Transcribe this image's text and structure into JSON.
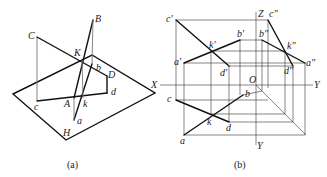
{
  "figure": {
    "panels": [
      {
        "id": "a",
        "caption": "(a)",
        "description": "Pictorial view: line AB piercing triangle-like plane CKD region with projection plane H",
        "labels": {
          "B": "B",
          "C": "C",
          "K": "K",
          "b": "b",
          "D": "D",
          "d": "d",
          "c": "c",
          "A": "A",
          "k": "k",
          "a": "a",
          "H": "H"
        }
      },
      {
        "id": "b",
        "caption": "(b)",
        "description": "Three-view orthographic projection with X, Y, Z axes and origin O",
        "labels": {
          "c1": "c'",
          "c2": "c\"",
          "Z": "Z",
          "k1": "k'",
          "b1": "b'",
          "b2": "b\"",
          "k2": "k\"",
          "a1": "a'",
          "a2": "a\"",
          "d1": "d'",
          "d2": "d\"",
          "X": "X",
          "O": "O",
          "Y_right": "Y",
          "b": "b",
          "c": "c",
          "k": "k",
          "d": "d",
          "a": "a",
          "Y_bottom": "Y"
        }
      }
    ]
  }
}
